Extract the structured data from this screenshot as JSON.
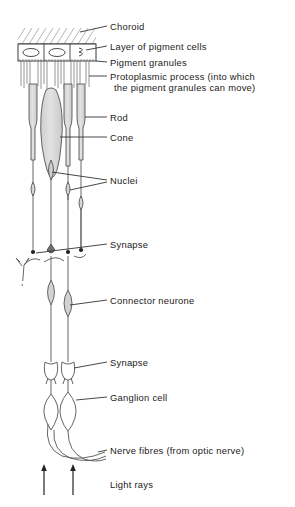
{
  "figure": {
    "domain": "biological-diagram",
    "colors": {
      "ink": "#2b2b2b",
      "line": "#555555",
      "cell_fill": "#d8d8d8",
      "cell_fill_light": "#e8e8e8",
      "background": "#ffffff",
      "text": "#1a1a1a"
    }
  },
  "labels": [
    {
      "id": "choroid",
      "text": "Choroid",
      "x": 110,
      "y": 22
    },
    {
      "id": "pigment-cell-layer",
      "text": "Layer of pigment cells",
      "x": 110,
      "y": 42
    },
    {
      "id": "pigment-granules",
      "text": "Pigment granules",
      "x": 110,
      "y": 58
    },
    {
      "id": "protoplasmic-process-line1",
      "text": "Protoplasmic process (into which",
      "x": 110,
      "y": 74
    },
    {
      "id": "protoplasmic-process-line2",
      "text": "the pigment granules can move)",
      "x": 114,
      "y": 85
    },
    {
      "id": "rod",
      "text": "Rod",
      "x": 110,
      "y": 113
    },
    {
      "id": "cone",
      "text": "Cone",
      "x": 110,
      "y": 133
    },
    {
      "id": "nuclei",
      "text": "Nuclei",
      "x": 110,
      "y": 176
    },
    {
      "id": "synapse-outer",
      "text": "Synapse",
      "x": 110,
      "y": 241
    },
    {
      "id": "connector-neurone",
      "text": "Connector neurone",
      "x": 110,
      "y": 296
    },
    {
      "id": "synapse-inner",
      "text": "Synapse",
      "x": 110,
      "y": 358
    },
    {
      "id": "ganglion-cell",
      "text": "Ganglion cell",
      "x": 110,
      "y": 393
    },
    {
      "id": "nerve-fibres",
      "text": "Nerve fibres (from optic nerve)",
      "x": 110,
      "y": 447
    },
    {
      "id": "light-rays",
      "text": "Light rays",
      "x": 110,
      "y": 481
    }
  ],
  "structures": {
    "choroid": {
      "name": "Choroid",
      "style": "hatched band",
      "top": 26,
      "bottom": 44
    },
    "pigment_cell_layer": {
      "name": "Layer of pigment cells",
      "cells": 3,
      "top": 44,
      "bottom": 62
    },
    "protoplasmic_processes": {
      "name": "Protoplasmic process",
      "count": 14,
      "top": 62,
      "bottom": 88
    },
    "photoreceptors": [
      {
        "type": "Rod",
        "x": 33
      },
      {
        "type": "Cone",
        "x": 50
      },
      {
        "type": "Rod",
        "x": 66
      },
      {
        "type": "Rod",
        "x": 80
      }
    ],
    "nuclei": {
      "name": "Nuclei",
      "count": 4
    },
    "synapse_outer": {
      "name": "Synapse",
      "y": 248
    },
    "connector_neurones": {
      "name": "Connector neurone",
      "count": 2
    },
    "synapse_inner": {
      "name": "Synapse",
      "y": 366
    },
    "ganglion_cells": {
      "name": "Ganglion cell",
      "count": 2
    },
    "nerve_fibres": {
      "name": "Nerve fibres (from optic nerve)",
      "count": 3
    },
    "light_ray_arrows": {
      "name": "Light rays",
      "count": 2,
      "direction": "up"
    }
  }
}
